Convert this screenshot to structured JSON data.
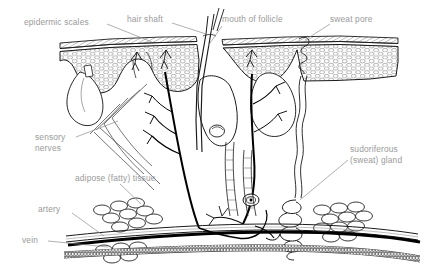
{
  "diagram": {
    "background_color": "#ffffff",
    "label_color": "#9a9a9a",
    "ink_color": "#000000",
    "labels": {
      "epidermic_scales": "epidermic scales",
      "hair_shaft": "hair shaft",
      "mouth_of_follicle": "mouth of follicle",
      "sweat_pore": "sweat pore",
      "sensory_nerves_line1": "sensory",
      "sensory_nerves_line2": "nerves",
      "adipose_tissue": "adipose (fatty) tissue",
      "artery": "artery",
      "vein": "vein",
      "sudoriferous_line1": "sudoriferous",
      "sudoriferous_line2": "(sweat) gland"
    },
    "structures": [
      "epidermis-hatched-layer",
      "stratum-granular-cell-layer",
      "dermal-papillae",
      "hair-shaft",
      "hair-follicle",
      "sebaceous-gland",
      "arrector-pili",
      "sweat-pore",
      "sweat-duct",
      "sudoriferous-gland-coil",
      "adipose-lobules",
      "artery",
      "vein",
      "sensory-nerve-branches",
      "pacinian-corpuscle"
    ]
  }
}
